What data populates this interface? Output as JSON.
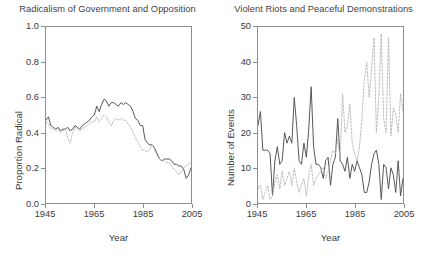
{
  "figure": {
    "width": 431,
    "height": 265,
    "background": "#ffffff",
    "axis_color": "#8e8e8e",
    "solid_series_color": "#555555",
    "dotted_series_color": "#b4b4b4"
  },
  "panels": [
    {
      "id": "left",
      "title": "Radicalism of Government and Opposition",
      "xlabel": "Year",
      "ylabel": "Proportion Radical"
    },
    {
      "id": "right",
      "title": "Violent Riots and Peaceful Demonstrations",
      "xlabel": "Year",
      "ylabel": "Number of Events"
    }
  ],
  "chart_data": [
    {
      "type": "line",
      "title": "Radicalism of Government and Opposition",
      "xlabel": "Year",
      "ylabel": "Proportion Radical",
      "xlim": [
        1945,
        2005
      ],
      "ylim": [
        0.0,
        1.0
      ],
      "xticks": [
        1945,
        1965,
        1985,
        2005
      ],
      "yticks": [
        0.0,
        0.2,
        0.4,
        0.6,
        0.8,
        1.0
      ],
      "ytick_labels": [
        "0.0",
        "0.2",
        "0.4",
        "0.6",
        "0.8",
        "1.0"
      ],
      "xtick_labels": [
        "1945",
        "1965",
        "1985",
        "2005"
      ],
      "grid": false,
      "legend": "none",
      "x": [
        1945,
        1946,
        1947,
        1948,
        1949,
        1950,
        1951,
        1952,
        1953,
        1954,
        1955,
        1956,
        1957,
        1958,
        1959,
        1960,
        1961,
        1962,
        1963,
        1964,
        1965,
        1966,
        1967,
        1968,
        1969,
        1970,
        1971,
        1972,
        1973,
        1974,
        1975,
        1976,
        1977,
        1978,
        1979,
        1980,
        1981,
        1982,
        1983,
        1984,
        1985,
        1986,
        1987,
        1988,
        1989,
        1990,
        1991,
        1992,
        1993,
        1994,
        1995,
        1996,
        1997,
        1998,
        1999,
        2000,
        2001,
        2002,
        2003,
        2004,
        2005
      ],
      "series": [
        {
          "name": "Government radicalism",
          "style": "solid",
          "color": "#555555",
          "values": [
            0.47,
            0.49,
            0.44,
            0.43,
            0.42,
            0.43,
            0.41,
            0.42,
            0.42,
            0.43,
            0.41,
            0.42,
            0.44,
            0.43,
            0.42,
            0.44,
            0.45,
            0.46,
            0.47,
            0.49,
            0.5,
            0.55,
            0.52,
            0.56,
            0.59,
            0.58,
            0.55,
            0.57,
            0.57,
            0.56,
            0.55,
            0.57,
            0.56,
            0.57,
            0.56,
            0.55,
            0.52,
            0.48,
            0.47,
            0.44,
            0.44,
            0.36,
            0.34,
            0.33,
            0.33,
            0.31,
            0.28,
            0.25,
            0.24,
            0.25,
            0.25,
            0.25,
            0.24,
            0.22,
            0.22,
            0.21,
            0.21,
            0.19,
            0.14,
            0.16,
            0.2
          ]
        },
        {
          "name": "Opposition radicalism",
          "style": "dotted",
          "color": "#b4b4b4",
          "values": [
            0.46,
            0.45,
            0.42,
            0.42,
            0.41,
            0.42,
            0.4,
            0.41,
            0.42,
            0.37,
            0.34,
            0.4,
            0.43,
            0.42,
            0.41,
            0.42,
            0.43,
            0.44,
            0.45,
            0.46,
            0.46,
            0.49,
            0.46,
            0.48,
            0.5,
            0.49,
            0.46,
            0.44,
            0.47,
            0.48,
            0.47,
            0.48,
            0.47,
            0.47,
            0.45,
            0.43,
            0.4,
            0.37,
            0.35,
            0.32,
            0.3,
            0.3,
            0.29,
            0.31,
            0.33,
            0.3,
            0.27,
            0.25,
            0.24,
            0.24,
            0.23,
            0.23,
            0.21,
            0.19,
            0.18,
            0.16,
            0.18,
            0.2,
            0.21,
            0.22,
            0.23
          ]
        }
      ]
    },
    {
      "type": "line",
      "title": "Violent Riots and Peaceful Demonstrations",
      "xlabel": "Year",
      "ylabel": "Number of Events",
      "xlim": [
        1945,
        2005
      ],
      "ylim": [
        0,
        50
      ],
      "xticks": [
        1945,
        1965,
        1985,
        2005
      ],
      "yticks": [
        0,
        10,
        20,
        30,
        40,
        50
      ],
      "ytick_labels": [
        "0",
        "10",
        "20",
        "30",
        "40",
        "50"
      ],
      "xtick_labels": [
        "1945",
        "1965",
        "1985",
        "2005"
      ],
      "grid": false,
      "legend": "none",
      "x": [
        1945,
        1946,
        1947,
        1948,
        1949,
        1950,
        1951,
        1952,
        1953,
        1954,
        1955,
        1956,
        1957,
        1958,
        1959,
        1960,
        1961,
        1962,
        1963,
        1964,
        1965,
        1966,
        1967,
        1968,
        1969,
        1970,
        1971,
        1972,
        1973,
        1974,
        1975,
        1976,
        1977,
        1978,
        1979,
        1980,
        1981,
        1982,
        1983,
        1984,
        1985,
        1986,
        1987,
        1988,
        1989,
        1990,
        1991,
        1992,
        1993,
        1994,
        1995,
        1996,
        1997,
        1998,
        1999,
        2000,
        2001,
        2002,
        2003,
        2004,
        2005
      ],
      "series": [
        {
          "name": "Violent riots",
          "style": "solid",
          "color": "#555555",
          "values": [
            22,
            26,
            15,
            15,
            15,
            14,
            2,
            12,
            16,
            11,
            12,
            20,
            17,
            19,
            17,
            30,
            22,
            12,
            11,
            17,
            13,
            21,
            33,
            16,
            11,
            11,
            10,
            7,
            12,
            13,
            5,
            11,
            13,
            24,
            12,
            11,
            9,
            13,
            7,
            11,
            9,
            12,
            10,
            8,
            3,
            3,
            6,
            11,
            14,
            15,
            11,
            1,
            11,
            10,
            4,
            10,
            8,
            3,
            12,
            2,
            7
          ]
        },
        {
          "name": "Peaceful demonstrations",
          "style": "dotted",
          "color": "#b4b4b4",
          "values": [
            4,
            5,
            1,
            3,
            5,
            1,
            2,
            6,
            8,
            4,
            9,
            5,
            7,
            9,
            5,
            10,
            6,
            3,
            5,
            7,
            2,
            8,
            11,
            5,
            7,
            8,
            9,
            10,
            7,
            9,
            12,
            15,
            14,
            18,
            13,
            31,
            20,
            22,
            28,
            17,
            14,
            12,
            16,
            24,
            35,
            40,
            30,
            38,
            47,
            20,
            30,
            48,
            24,
            20,
            47,
            19,
            27,
            25,
            20,
            31,
            26
          ]
        }
      ]
    }
  ]
}
